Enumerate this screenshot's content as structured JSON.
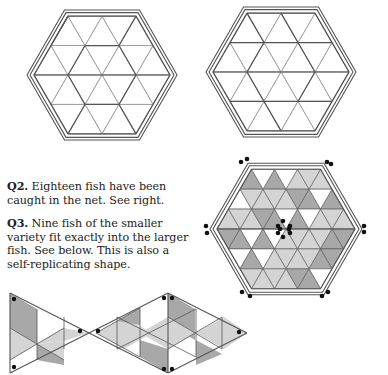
{
  "questions": [
    {
      "label": "Q2.",
      "text": " Eighteen fish have been caught in the net. See right."
    },
    {
      "label": "Q3.",
      "text": " Nine fish of the smaller variety fit exactly into the larger fish. See below. This is also a self-replicating shape."
    }
  ],
  "figures": {
    "top_left": {
      "name": "empty-hex-net-small",
      "side_triangles": 2
    },
    "top_right": {
      "name": "empty-hex-net-small-alt",
      "side_triangles": 2
    },
    "net_solution": {
      "name": "hex-net-eighteen-fish",
      "side_triangles": 3,
      "fish_count": 18
    },
    "fish_solution": {
      "name": "large-fish-nine-small",
      "small_fish_count": 9
    }
  },
  "colors": {
    "line": "#555555",
    "light_line": "#9a9a9a",
    "shade_dark": "#a8a8a8",
    "shade_light": "#d4d4d4",
    "white": "#ffffff",
    "dot": "#111111"
  }
}
